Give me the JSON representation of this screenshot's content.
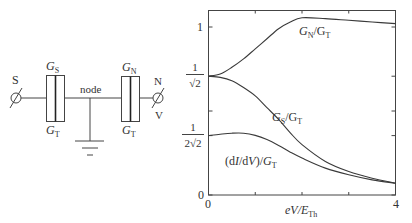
{
  "circuit": {
    "terminal_left": "S",
    "terminal_right_top": "N",
    "terminal_right_bottom": "V",
    "node_label": "node",
    "left_junction": {
      "top_label": "G",
      "top_sub": "S",
      "bottom_label": "G",
      "bottom_sub": "T"
    },
    "right_junction": {
      "top_label": "G",
      "top_sub": "N",
      "bottom_label": "G",
      "bottom_sub": "T"
    }
  },
  "chart_data": {
    "type": "line",
    "title": "",
    "xlabel": "eV/E_Th",
    "ylabel": "",
    "xlim": [
      0,
      4
    ],
    "ylim": [
      0,
      1.1
    ],
    "grid": false,
    "x_ticks": [
      0,
      1,
      2,
      3,
      4
    ],
    "x_tick_labels": {
      "0": "0",
      "4": "4"
    },
    "y_ticks": [
      0,
      0.3536,
      0.5,
      0.7071,
      1
    ],
    "y_tick_labels": [
      "0",
      "1/(2√2)",
      "",
      "1/√2",
      "1"
    ],
    "x": [
      0,
      0.25,
      0.5,
      0.75,
      1.0,
      1.25,
      1.5,
      1.75,
      2.0,
      2.5,
      3.0,
      3.5,
      4.0
    ],
    "series": [
      {
        "name": "G_N/G_T",
        "values": [
          0.707,
          0.72,
          0.76,
          0.81,
          0.87,
          0.93,
          0.99,
          1.03,
          1.055,
          1.05,
          1.04,
          1.03,
          1.02
        ]
      },
      {
        "name": "G_S/G_T",
        "values": [
          0.707,
          0.7,
          0.68,
          0.64,
          0.59,
          0.52,
          0.45,
          0.37,
          0.3,
          0.2,
          0.14,
          0.1,
          0.07
        ]
      },
      {
        "name": "(dI/dV)/G_T",
        "values": [
          0.354,
          0.362,
          0.368,
          0.368,
          0.355,
          0.33,
          0.295,
          0.255,
          0.22,
          0.16,
          0.12,
          0.09,
          0.07
        ]
      }
    ],
    "annotations": [
      {
        "text": "G_N/G_T",
        "series": 0,
        "x": 2.3,
        "y": 0.95
      },
      {
        "text": "G_S/G_T",
        "series": 1,
        "x": 1.9,
        "y": 0.49
      },
      {
        "text": "(dI/dV)/G_T",
        "series": 2,
        "x": 0.5,
        "y": 0.2
      }
    ]
  }
}
